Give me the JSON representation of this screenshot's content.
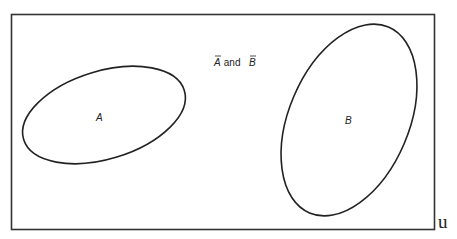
{
  "diagram": {
    "type": "venn",
    "universe_label": "u",
    "sets": [
      {
        "name": "A",
        "label": "A"
      },
      {
        "name": "B",
        "label": "B"
      }
    ],
    "region_label": {
      "parts": [
        "A",
        " and ",
        "B"
      ],
      "complement_bars": [
        true,
        false,
        true
      ]
    },
    "colors": {
      "stroke": "#222222",
      "background": "#ffffff"
    }
  }
}
